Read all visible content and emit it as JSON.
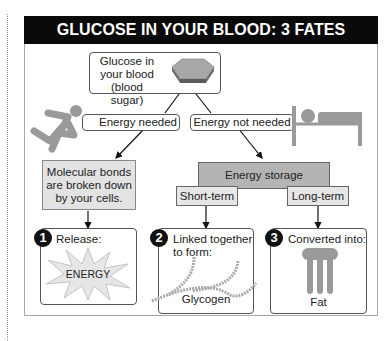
{
  "title": "GLUCOSE IN YOUR BLOOD: 3 FATES",
  "glucose_box": {
    "lines": [
      "Glucose in",
      "your blood",
      "(blood sugar)"
    ],
    "icon": "hexagon-molecule-icon"
  },
  "branches": {
    "left": {
      "label": "Energy needed",
      "icon": "running-person-icon"
    },
    "right": {
      "label": "Energy not needed",
      "icon": "person-in-bed-icon"
    }
  },
  "breakdown_box": {
    "lines": [
      "Molecular bonds",
      "are broken down",
      "by your cells."
    ]
  },
  "storage_box": {
    "label": "Energy storage",
    "short_term": "Short-term",
    "long_term": "Long-term"
  },
  "fates": [
    {
      "number": "1",
      "label": "Release:",
      "content": "ENERGY",
      "icon": "energy-burst-icon"
    },
    {
      "number": "2",
      "label_lines": [
        "Linked together",
        "to form:"
      ],
      "content": "Glycogen",
      "icon": "glycogen-chains-icon"
    },
    {
      "number": "3",
      "label": "Converted into:",
      "content": "Fat",
      "icon": "fat-molecule-icon"
    }
  ],
  "colors": {
    "title_bg": "#0a0a0a",
    "title_text": "#ffffff",
    "box_light": "#e3e3e3",
    "box_dark": "#b4b4b4",
    "icon_gray": "#9a9a9a"
  }
}
